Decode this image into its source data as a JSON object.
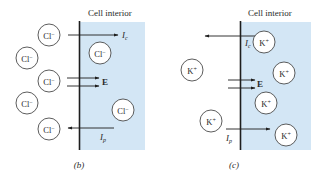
{
  "colors": {
    "interior_fill": "#d3e6f5",
    "line": "#1e1e1e",
    "circle_fill": "#ffffff"
  },
  "panels": [
    {
      "id": "b",
      "caption": "(b)",
      "interior_label": "Cell interior",
      "ion": {
        "base": "Cl",
        "sign": "−"
      },
      "ions_outside": 5,
      "ions_inside": 2,
      "currents": {
        "ic": {
          "base": "I",
          "sub": "c",
          "direction": "inward"
        },
        "ip": {
          "base": "I",
          "sub": "p",
          "direction": "outward"
        }
      },
      "field_label": "E"
    },
    {
      "id": "c",
      "caption": "(c)",
      "interior_label": "Cell interior",
      "ion": {
        "base": "K",
        "sign": "+"
      },
      "ions_outside": 2,
      "ions_inside": 4,
      "currents": {
        "ic": {
          "base": "I",
          "sub": "c",
          "direction": "outward"
        },
        "ip": {
          "base": "I",
          "sub": "p",
          "direction": "inward"
        }
      },
      "field_label": "E"
    }
  ]
}
